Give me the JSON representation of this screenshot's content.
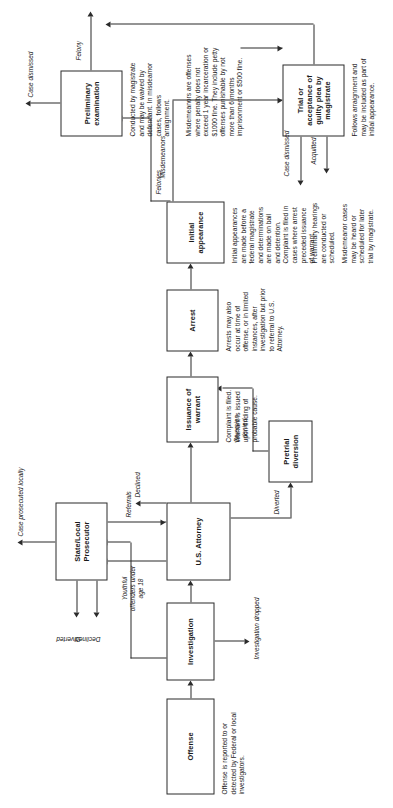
{
  "diagram": {
    "orientation": "rotated-90-ccw",
    "ink_color": "#2b2b2b",
    "paper_color": "#ffffff"
  },
  "nodes": {
    "offense": {
      "label": "Offense",
      "description": "Offense is reported to or detected by Federal or local investigators."
    },
    "investigation": {
      "label": "Investigation",
      "description": ""
    },
    "state_local_prosecutor": {
      "label": "State/Local Prosecutor",
      "description": ""
    },
    "us_attorney": {
      "label": "U.S. Attorney",
      "description": ""
    },
    "pretrial_diversion": {
      "label": "Pretrial diversion",
      "description": ""
    },
    "issuance_of_warrant": {
      "label": "Issuance of warrant",
      "description": "Complaint is filed. Warrant is issued upon finding of probable cause."
    },
    "arrest": {
      "label": "Arrest",
      "description": "Arrests may also occur at time of offense, or in limited instances, after investigation but prior to referral to U.S. Attorney."
    },
    "initial_appearance": {
      "label": "Initial appearance",
      "description_1": "Initial appearances are made before a federal magistrate and determinations are made on bail and detention. Complaint is filed in cases where arrest preceded issuance of warrant.",
      "description_2": "Preliminary hearings are conducted or scheduled.",
      "description_3": "Misdemeanor cases may be heard or scheduled for later trial by magistrate."
    },
    "preliminary_examination": {
      "label": "Preliminary examination",
      "description": "Conducted by magistrate and may be waived by defendant. In misdeamor cases, follows arraignment."
    },
    "trial_or_guilty_plea": {
      "label": "Trial or acceptance of guilty plea by magistrate",
      "description": "Follows arraignment and may be included as part of initial appearance."
    }
  },
  "notes": {
    "misdemeanors_note": "Misdemeanors are offenses where penalty does not exceed 1 year incarceration or $1000 fine. They include petty offenses punishable by not more than 6 months imprisonment or $500 fine."
  },
  "edge_labels": {
    "investigation_dropped": "Investigation dropped",
    "declined_slp_out": "Declined",
    "diverted_slp_out": "Diverted",
    "case_prosecuted_locally": "Case prosecuted locally",
    "youthful_offenders": "Youthful offenders under age 18",
    "referrals": "Referrals",
    "declined_usa": "Declined",
    "diverted_pretrial": "Diverted",
    "diversion_denied": "Diversion denied",
    "felonies": "Felonies",
    "misdemeanors": "Misdemeanors",
    "felony": "Felony",
    "case_dismissed_prelim": "Case dismissed",
    "case_dismissed_trial": "Case dismissed",
    "acquitted": "Acquitted"
  }
}
